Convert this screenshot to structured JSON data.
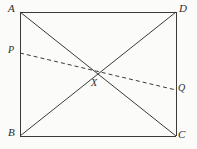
{
  "figure": {
    "kind": "geometry-diagram",
    "background_color": "#fbfbf9",
    "stroke_color": "#3a3a3a",
    "stroke_width": 1,
    "dash_pattern": "4 3",
    "canvas": {
      "width": 197,
      "height": 149
    }
  },
  "rectangle": {
    "name": "ABCD",
    "corners": {
      "A": {
        "label": "A",
        "x": 20,
        "y": 12
      },
      "D": {
        "label": "D",
        "x": 176,
        "y": 12
      },
      "B": {
        "label": "B",
        "x": 20,
        "y": 136
      },
      "C": {
        "label": "C",
        "x": 176,
        "y": 136
      }
    }
  },
  "diagonals": [
    {
      "name": "AC",
      "from": "A",
      "to": "C",
      "style": "solid"
    },
    {
      "name": "DB",
      "from": "D",
      "to": "B",
      "style": "solid"
    }
  ],
  "intersection": {
    "label": "X",
    "x": 97,
    "y": 74
  },
  "dashed_segment": {
    "name": "PQ",
    "style": "dashed",
    "endpoints": {
      "P": {
        "label": "P",
        "x": 20,
        "y": 53
      },
      "Q": {
        "label": "Q",
        "x": 176,
        "y": 90
      }
    }
  }
}
